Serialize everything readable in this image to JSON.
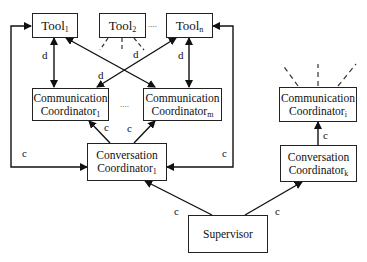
{
  "diagram": {
    "type": "hierarchy",
    "nodes": {
      "tool1": {
        "label": "Tool",
        "sub": "1"
      },
      "tool2": {
        "label": "Tool",
        "sub": "2"
      },
      "tooln": {
        "label": "Tool",
        "sub": "n"
      },
      "comm1": {
        "line1": "Communication",
        "line2": "Coordinator",
        "sub": "1"
      },
      "commm": {
        "line1": "Communication",
        "line2": "Coordinator",
        "sub": "m"
      },
      "commi": {
        "line1": "Communication",
        "line2": "Coordinator",
        "sub": "i"
      },
      "conv1": {
        "line1": "Conversation",
        "line2": "Coordinator",
        "sub": "1"
      },
      "convk": {
        "line1": "Conversation",
        "line2": "Coordinator",
        "sub": "k"
      },
      "supervisor": {
        "label": "Supervisor"
      }
    },
    "edge_labels": {
      "d": "d",
      "c": "c"
    },
    "ellipsis": {
      "tools": "....",
      "comm": "...."
    },
    "edges": [
      {
        "from": "tool1",
        "to": "comm1",
        "label": "d",
        "style": "bidirectional"
      },
      {
        "from": "tool1",
        "to": "commm",
        "label": "d",
        "style": "bidirectional"
      },
      {
        "from": "tooln",
        "to": "comm1",
        "label": "d",
        "style": "bidirectional"
      },
      {
        "from": "tooln",
        "to": "commm",
        "label": "d",
        "style": "bidirectional"
      },
      {
        "from": "tool2",
        "to": "(implied)",
        "label": "d",
        "style": "dashed"
      },
      {
        "from": "conv1",
        "to": "comm1",
        "label": "c"
      },
      {
        "from": "conv1",
        "to": "commm",
        "label": "c"
      },
      {
        "from": "conv1",
        "to": "tool1",
        "label": "c"
      },
      {
        "from": "conv1",
        "to": "tooln",
        "label": "c"
      },
      {
        "from": "convk",
        "to": "commi",
        "label": "c"
      },
      {
        "from": "supervisor",
        "to": "conv1",
        "label": "c"
      },
      {
        "from": "supervisor",
        "to": "convk",
        "label": "c"
      },
      {
        "from": "commi",
        "to": "(implied)",
        "style": "dashed"
      }
    ]
  }
}
